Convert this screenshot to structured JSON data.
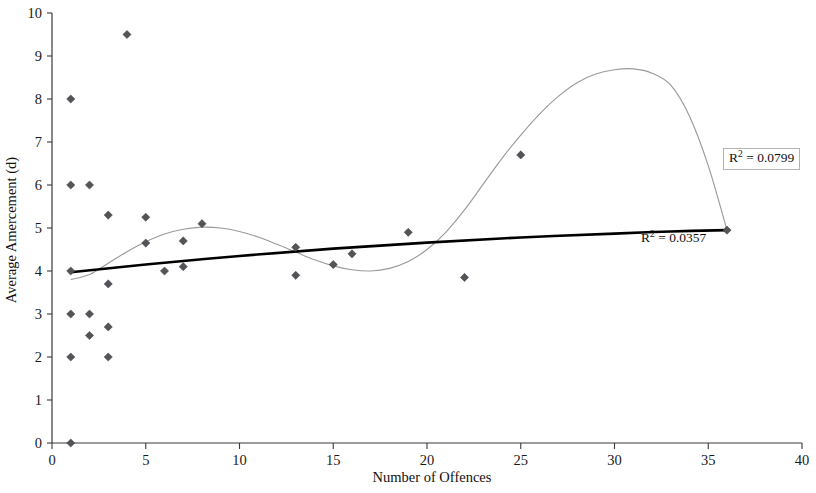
{
  "chart_data": {
    "type": "scatter",
    "title": "",
    "xlabel": "Number of Offences",
    "ylabel": "Average Amercement (d)",
    "xlim": [
      0,
      40
    ],
    "ylim": [
      0,
      10
    ],
    "xticks": [
      0,
      5,
      10,
      15,
      20,
      25,
      30,
      35,
      40
    ],
    "yticks": [
      0,
      1,
      2,
      3,
      4,
      5,
      6,
      7,
      8,
      9,
      10
    ],
    "xtick_labels": [
      "0",
      "5",
      "10",
      "15",
      "20",
      "25",
      "30",
      "35",
      "40"
    ],
    "ytick_labels": [
      "0",
      "1",
      "2",
      "3",
      "4",
      "5",
      "6",
      "7",
      "8",
      "9",
      "10"
    ],
    "grid": false,
    "legend": "none",
    "marker_style": "diamond",
    "marker_color": "#555358",
    "points": [
      {
        "x": 1,
        "y": 0.0
      },
      {
        "x": 1,
        "y": 2.0
      },
      {
        "x": 1,
        "y": 3.0
      },
      {
        "x": 1,
        "y": 4.0
      },
      {
        "x": 1,
        "y": 6.0
      },
      {
        "x": 1,
        "y": 8.0
      },
      {
        "x": 2,
        "y": 2.5
      },
      {
        "x": 2,
        "y": 3.0
      },
      {
        "x": 2,
        "y": 6.0
      },
      {
        "x": 3,
        "y": 2.0
      },
      {
        "x": 3,
        "y": 2.7
      },
      {
        "x": 3,
        "y": 3.7
      },
      {
        "x": 3,
        "y": 5.3
      },
      {
        "x": 4,
        "y": 9.5
      },
      {
        "x": 5,
        "y": 4.65
      },
      {
        "x": 5,
        "y": 5.25
      },
      {
        "x": 6,
        "y": 4.0
      },
      {
        "x": 7,
        "y": 4.1
      },
      {
        "x": 7,
        "y": 4.7
      },
      {
        "x": 8,
        "y": 5.1
      },
      {
        "x": 13,
        "y": 3.9
      },
      {
        "x": 13,
        "y": 4.55
      },
      {
        "x": 15,
        "y": 4.15
      },
      {
        "x": 16,
        "y": 4.4
      },
      {
        "x": 19,
        "y": 4.9
      },
      {
        "x": 22,
        "y": 3.85
      },
      {
        "x": 25,
        "y": 6.7
      },
      {
        "x": 36,
        "y": 4.95
      }
    ],
    "series": [
      {
        "name": "linear-trendline",
        "type": "line",
        "color": "#000000",
        "r_squared": "0.0357",
        "label": "R² = 0.0357",
        "points": [
          {
            "x": 1,
            "y": 3.97
          },
          {
            "x": 5,
            "y": 4.15
          },
          {
            "x": 10,
            "y": 4.35
          },
          {
            "x": 15,
            "y": 4.52
          },
          {
            "x": 20,
            "y": 4.66
          },
          {
            "x": 25,
            "y": 4.78
          },
          {
            "x": 30,
            "y": 4.87
          },
          {
            "x": 33,
            "y": 4.92
          },
          {
            "x": 36,
            "y": 4.95
          }
        ]
      },
      {
        "name": "polynomial-trendline",
        "type": "line",
        "color": "#9a9a9a",
        "r_squared": "0.0799",
        "label": "R² = 0.0799",
        "points": [
          {
            "x": 1,
            "y": 3.8
          },
          {
            "x": 2,
            "y": 3.92
          },
          {
            "x": 3,
            "y": 4.18
          },
          {
            "x": 4,
            "y": 4.45
          },
          {
            "x": 5,
            "y": 4.68
          },
          {
            "x": 6,
            "y": 4.86
          },
          {
            "x": 7,
            "y": 4.97
          },
          {
            "x": 8,
            "y": 5.02
          },
          {
            "x": 9,
            "y": 5.0
          },
          {
            "x": 10,
            "y": 4.92
          },
          {
            "x": 11,
            "y": 4.79
          },
          {
            "x": 12,
            "y": 4.62
          },
          {
            "x": 13,
            "y": 4.44
          },
          {
            "x": 14,
            "y": 4.26
          },
          {
            "x": 15,
            "y": 4.12
          },
          {
            "x": 16,
            "y": 4.03
          },
          {
            "x": 17,
            "y": 4.0
          },
          {
            "x": 18,
            "y": 4.06
          },
          {
            "x": 19,
            "y": 4.22
          },
          {
            "x": 20,
            "y": 4.5
          },
          {
            "x": 21,
            "y": 4.9
          },
          {
            "x": 22,
            "y": 5.42
          },
          {
            "x": 23,
            "y": 6.02
          },
          {
            "x": 24,
            "y": 6.62
          },
          {
            "x": 25,
            "y": 7.16
          },
          {
            "x": 26,
            "y": 7.65
          },
          {
            "x": 27,
            "y": 8.06
          },
          {
            "x": 28,
            "y": 8.38
          },
          {
            "x": 29,
            "y": 8.58
          },
          {
            "x": 30,
            "y": 8.68
          },
          {
            "x": 31,
            "y": 8.7
          },
          {
            "x": 32,
            "y": 8.6
          },
          {
            "x": 33,
            "y": 8.32
          },
          {
            "x": 34,
            "y": 7.6
          },
          {
            "x": 35,
            "y": 6.45
          },
          {
            "x": 36,
            "y": 4.95
          }
        ]
      }
    ],
    "annotations": [
      {
        "name": "r2-poly",
        "text_prefix": "R",
        "text_sup": "2",
        "text_suffix": " = 0.0799",
        "boxed": true
      },
      {
        "name": "r2-linear",
        "text_prefix": "R",
        "text_sup": "2",
        "text_suffix": " = 0.0357",
        "boxed": false
      }
    ]
  }
}
